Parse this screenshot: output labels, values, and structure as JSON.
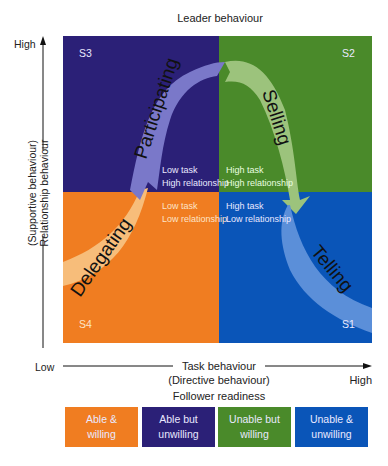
{
  "title": "Leader behaviour",
  "y_axis": {
    "high": "High",
    "low": "Low",
    "label_line1": "(Supportive behaviour)",
    "label_line2": "Relationship behaviour"
  },
  "x_axis": {
    "label_line1": "Task behaviour",
    "label_line2": "(Directive behaviour)",
    "high": "High"
  },
  "follower_readiness": {
    "title": "Follower readiness",
    "boxes": [
      {
        "label": "Able &\nwilling",
        "color": "#f07d21"
      },
      {
        "label": "Able but\nunwilling",
        "color": "#2b2077"
      },
      {
        "label": "Unable but\nwilling",
        "color": "#4a8a2a"
      },
      {
        "label": "Unable &\nunwilling",
        "color": "#0a55b8"
      }
    ]
  },
  "quadrants": [
    {
      "id": "S3",
      "color": "#2b2077",
      "task": "Low task",
      "relationship": "High relationship",
      "style": "Participating",
      "band_color": "#7a78c9"
    },
    {
      "id": "S2",
      "color": "#4a8a2a",
      "task": "High task",
      "relationship": "High relationship",
      "style": "Selling",
      "band_color": "#9cc37c"
    },
    {
      "id": "S4",
      "color": "#f07d21",
      "task": "Low task",
      "relationship": "Low relationship",
      "style": "Delegating",
      "band_color": "#f7bd7a"
    },
    {
      "id": "S1",
      "color": "#0a55b8",
      "task": "High task",
      "relationship": "Low relationship",
      "style": "Telling",
      "band_color": "#5b8fd9"
    }
  ]
}
